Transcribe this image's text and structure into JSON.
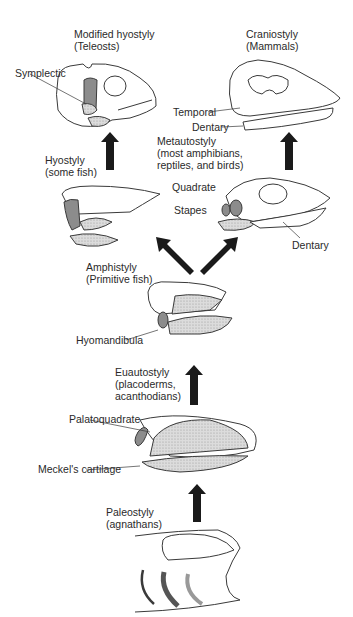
{
  "stages": {
    "modified_hyostyly": {
      "name": "Modified hyostyly",
      "group": "(Teleosts)",
      "parts": {
        "symplectic": "Symplectic"
      }
    },
    "craniostyly": {
      "name": "Craniostyly",
      "group": "(Mammals)",
      "parts": {
        "temporal": "Temporal",
        "dentary": "Dentary"
      }
    },
    "hyostyly": {
      "name": "Hyostyly",
      "group": "(some fish)"
    },
    "metautostyly": {
      "name": "Metautostyly",
      "group_lines": [
        "(most amphibians,",
        "reptiles, and birds)"
      ],
      "parts": {
        "quadrate": "Quadrate",
        "stapes": "Stapes",
        "dentary": "Dentary"
      }
    },
    "amphistyly": {
      "name": "Amphistyly",
      "group": "(Primitive fish)",
      "parts": {
        "hyomandibula": "Hyomandibula"
      }
    },
    "euautostyly": {
      "name": "Euautostyly",
      "group_lines": [
        "(placoderms,",
        "acanthodians)"
      ],
      "parts": {
        "palatoquadrate": "Palatoquadrate",
        "meckels": "Meckel's cartilage"
      }
    },
    "paleostyly": {
      "name": "Paleostyly",
      "group": "(agnathans)"
    }
  },
  "colors": {
    "line": "#3a3a3a",
    "dark_fill": "#8c8c8c",
    "stipple": "#d4d4d4",
    "arrow": "#1a1a1a"
  }
}
